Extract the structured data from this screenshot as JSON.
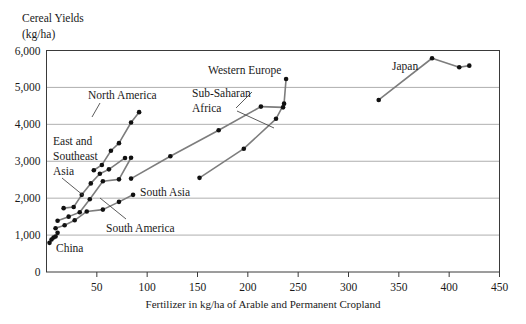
{
  "chart_data": {
    "type": "line",
    "title": "",
    "ylabel": "Cereal Yields\n(kg/ha)",
    "ylabel_line1": "Cereal Yields",
    "ylabel_line2": "(kg/ha)",
    "xlabel": "Fertilizer in kg/ha of Arable and Permanent Cropland",
    "xlim": [
      0,
      450
    ],
    "ylim": [
      0,
      6000
    ],
    "xticks": [
      0,
      50,
      100,
      150,
      200,
      250,
      300,
      350,
      400,
      450
    ],
    "xticklabels": [
      "",
      "50",
      "100",
      "150",
      "200",
      "250",
      "300",
      "350",
      "400",
      "450"
    ],
    "yticks": [
      0,
      1000,
      2000,
      3000,
      4000,
      5000,
      6000
    ],
    "yticklabels": [
      "0",
      "1,000",
      "2,000",
      "3,000",
      "4,000",
      "5,000",
      "6,000"
    ],
    "grid": "horizontal",
    "legend": "inline-annotations",
    "line_color": "#7d7d7d",
    "marker_color": "#111111",
    "series": [
      {
        "name": "North America",
        "label": "North America",
        "points": [
          [
            47,
            2755
          ],
          [
            55,
            2900
          ],
          [
            64,
            3285
          ],
          [
            72,
            3490
          ],
          [
            84,
            4050
          ],
          [
            92,
            4330
          ]
        ]
      },
      {
        "name": "Western Europe",
        "label": "Western Europe",
        "points": [
          [
            152,
            2550
          ],
          [
            196,
            3340
          ],
          [
            228,
            4150
          ],
          [
            236,
            4560
          ],
          [
            238,
            5230
          ]
        ]
      },
      {
        "name": "Sub-Saharan Africa",
        "label": "Sub-Saharan Africa",
        "points": [
          [
            84,
            2530
          ],
          [
            123,
            3135
          ],
          [
            171,
            3840
          ],
          [
            213,
            4480
          ],
          [
            235,
            4460
          ]
        ]
      },
      {
        "name": "East and Southeast Asia",
        "label": "East and Southeast Asia",
        "label_line1": "East and",
        "label_line2": "Southeast",
        "label_line3": "Asia",
        "points": [
          [
            17,
            1730
          ],
          [
            27,
            1760
          ],
          [
            35,
            2090
          ],
          [
            44,
            2400
          ],
          [
            53,
            2660
          ],
          [
            62,
            2780
          ],
          [
            78,
            3090
          ]
        ]
      },
      {
        "name": "South Asia",
        "label": "South Asia",
        "points": [
          [
            11,
            1390
          ],
          [
            22,
            1500
          ],
          [
            33,
            1620
          ],
          [
            43,
            1970
          ],
          [
            56,
            2460
          ],
          [
            72,
            2510
          ],
          [
            84,
            3095
          ]
        ]
      },
      {
        "name": "South America",
        "label": "South America",
        "points": [
          [
            9,
            1185
          ],
          [
            18,
            1265
          ],
          [
            28,
            1400
          ],
          [
            40,
            1640
          ],
          [
            56,
            1690
          ],
          [
            72,
            1900
          ],
          [
            86,
            2090
          ]
        ]
      },
      {
        "name": "China",
        "label": "China",
        "points": [
          [
            3,
            790
          ],
          [
            5,
            880
          ],
          [
            7,
            935
          ],
          [
            9,
            960
          ],
          [
            11,
            1060
          ]
        ]
      },
      {
        "name": "Japan",
        "label": "Japan",
        "points": [
          [
            330,
            4660
          ],
          [
            383,
            5790
          ],
          [
            410,
            5545
          ],
          [
            420,
            5590
          ]
        ]
      }
    ]
  },
  "annotations": {
    "north_america": "North America",
    "western_europe": "Western Europe",
    "sub_saharan_africa_l1": "Sub-Saharan",
    "sub_saharan_africa_l2": "Africa",
    "east_southeast_asia_l1": "East and",
    "east_southeast_asia_l2": "Southeast",
    "east_southeast_asia_l3": "Asia",
    "south_asia": "South Asia",
    "south_america": "South America",
    "china": "China",
    "japan": "Japan"
  }
}
